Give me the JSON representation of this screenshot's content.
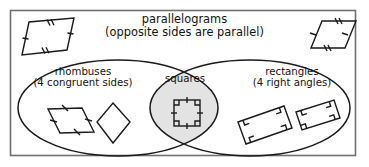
{
  "diagram": {
    "type": "venn-diagram",
    "title": "parallelograms",
    "subtitle": "(opposite sides are parallel)",
    "frame": {
      "border_color": "#6f6f6f",
      "background": "#ffffff"
    },
    "stroke_color": "#1a1a1a",
    "intersection_fill": "#e3e3e3",
    "sets": [
      {
        "id": "rhombuses",
        "name": "rhombuses",
        "description": "(4 congruent sides)",
        "fill": "#ffffff"
      },
      {
        "id": "squares",
        "name": "squares",
        "description": "",
        "fill": "#e3e3e3"
      },
      {
        "id": "rectangles",
        "name": "rectangles",
        "description": "(4 right angles)",
        "fill": "#ffffff"
      }
    ],
    "figures": [
      {
        "id": "parallelogram-top-left",
        "shape": "parallelogram",
        "region": "parallelograms-only",
        "marks": "tick-marks"
      },
      {
        "id": "parallelogram-top-right",
        "shape": "parallelogram",
        "region": "parallelograms-only",
        "marks": "tick-marks"
      },
      {
        "id": "rhombus-slanted",
        "shape": "rhombus",
        "region": "rhombuses",
        "marks": "tick-marks"
      },
      {
        "id": "rhombus-diamond",
        "shape": "rhombus",
        "region": "rhombuses",
        "marks": "none"
      },
      {
        "id": "square-center",
        "shape": "square",
        "region": "squares",
        "marks": "tick-marks-and-right-angles"
      },
      {
        "id": "rectangle-left-tilted",
        "shape": "rectangle",
        "region": "rectangles",
        "marks": "right-angles"
      },
      {
        "id": "rectangle-right-tilted",
        "shape": "rectangle",
        "region": "rectangles",
        "marks": "right-angles"
      }
    ]
  }
}
